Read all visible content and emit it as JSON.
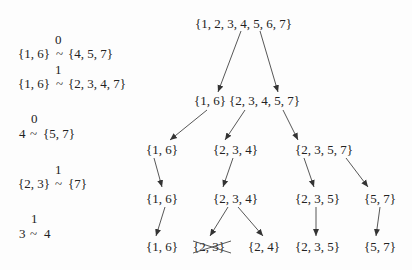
{
  "relations": [
    {
      "label": "0",
      "lhs": "{1, 6}",
      "rhs": "{4, 5, 7}"
    },
    {
      "label": "1",
      "lhs": "{1, 6}",
      "rhs": "{2, 3, 4, 7}"
    },
    {
      "label": "0",
      "lhs": "4",
      "rhs": "{5, 7}"
    },
    {
      "label": "1",
      "lhs": "{2, 3}",
      "rhs": "{7}"
    },
    {
      "label": "1",
      "lhs": "3",
      "rhs": "4"
    }
  ],
  "relation_symbol": "~",
  "tree": {
    "root": "{1, 2, 3, 4, 5, 6, 7}",
    "level1": [
      "{1, 6}",
      "{2, 3, 4, 5, 7}"
    ],
    "level2": [
      "{1, 6}",
      "{2, 3, 4}",
      "{2, 3, 5, 7}"
    ],
    "level3": [
      "{1, 6}",
      "{2, 3, 4}",
      "{2, 3, 5}",
      "{5, 7}"
    ],
    "level4": [
      {
        "text": "{1, 6}",
        "crossed": false
      },
      {
        "text": "{2, 3}",
        "crossed": true
      },
      {
        "text": "{2, 4}",
        "crossed": false
      },
      {
        "text": "{2, 3, 5}",
        "crossed": false
      },
      {
        "text": "{5, 7}",
        "crossed": false
      }
    ]
  }
}
